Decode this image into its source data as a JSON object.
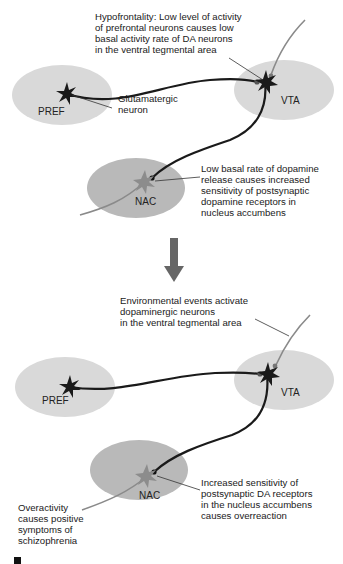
{
  "panels": [
    {
      "id": "top",
      "regions": {
        "pref": "PREF",
        "vta": "VTA",
        "nac": "NAC"
      },
      "annotations": {
        "hypofrontality": [
          "Hypofrontality: Low level of activity",
          "of prefrontal neurons causes low",
          "basal activity rate of DA neurons",
          "in the ventral tegmental area"
        ],
        "glutamatergic": [
          "Glutamatergic",
          "neuron"
        ],
        "low_basal": [
          "Low basal rate of dopamine",
          "release causes increased",
          "sensitivity of postsynaptic",
          "dopamine receptors in",
          "nucleus accumbens"
        ]
      }
    },
    {
      "id": "bottom",
      "regions": {
        "pref": "PREF",
        "vta": "VTA",
        "nac": "NAC"
      },
      "annotations": {
        "environmental": [
          "Environmental events activate",
          "dopaminergic neurons",
          "in the ventral tegmental area"
        ],
        "increased_sensitivity": [
          "Increased sensitivity of",
          "postsynaptic DA receptors",
          "in the nucleus accumbens",
          "causes overreaction"
        ],
        "overactivity": [
          "Overactivity",
          "causes positive",
          "symptoms of",
          "schizophrenia"
        ]
      }
    }
  ],
  "transition_arrow": "down-arrow",
  "colors": {
    "region_light": "#d9d9d9",
    "region_nac": "#b9b9b9",
    "neuron_dark": "#1a1a1a",
    "neuron_gray": "#8a8a8a",
    "arrow": "#666666"
  }
}
